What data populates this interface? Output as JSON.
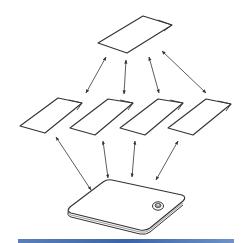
{
  "figure": {
    "top_card": {
      "id": "card-top",
      "points": "98,43 143,16 172,25 127,53",
      "fold": "158,20 172,25 164,31"
    },
    "middle_cards": [
      {
        "id": "card-1",
        "points": "20,126 58,98 82,103 45,133",
        "fold": "69,100 82,103 77,110"
      },
      {
        "id": "card-2",
        "points": "70,128 108,99 133,103 95,135",
        "fold": "120,100 133,103 128,110"
      },
      {
        "id": "card-3",
        "points": "120,128 158,99 183,103 145,135",
        "fold": "170,100 183,103 178,110"
      },
      {
        "id": "card-4",
        "points": "168,128 206,99 231,104 193,135",
        "fold": "218,101 231,104 226,111"
      }
    ],
    "arrows_top_to_middle": [
      {
        "x1": 106,
        "y1": 57,
        "x2": 86,
        "y2": 93
      },
      {
        "x1": 126,
        "y1": 60,
        "x2": 124,
        "y2": 94
      },
      {
        "x1": 149,
        "y1": 57,
        "x2": 159,
        "y2": 93
      },
      {
        "x1": 162,
        "y1": 51,
        "x2": 206,
        "y2": 93
      }
    ],
    "arrows_middle_to_device": [
      {
        "x1": 56,
        "y1": 137,
        "x2": 91,
        "y2": 190
      },
      {
        "x1": 103,
        "y1": 141,
        "x2": 108,
        "y2": 178
      },
      {
        "x1": 135,
        "y1": 141,
        "x2": 132,
        "y2": 177
      },
      {
        "x1": 178,
        "y1": 141,
        "x2": 156,
        "y2": 180
      }
    ],
    "device": {
      "button_center": [
        158,
        206
      ]
    },
    "colors": {
      "stroke": "#333333",
      "bottom_bar": "#3a64a8"
    }
  }
}
